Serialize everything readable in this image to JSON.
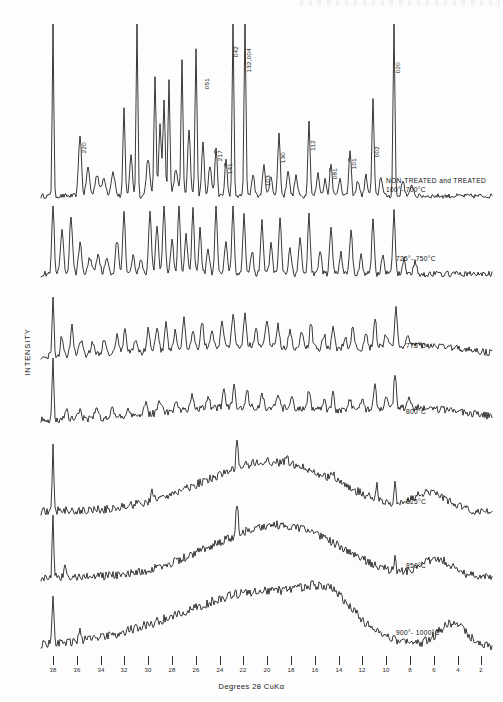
{
  "figure": {
    "ylabel": "INTENSITY",
    "xlabel": "Degrees 2θ CuKα"
  },
  "chart_data": {
    "type": "line",
    "title": "",
    "xlabel": "Degrees 2θ CuKα",
    "ylabel": "INTENSITY",
    "xlim": [
      39,
      1
    ],
    "x_axis_reversed": true,
    "grid": false,
    "legend": "inline-right-of-each-trace",
    "tick_labels": [
      "38",
      "36",
      "34",
      "32",
      "30",
      "28",
      "26",
      "24",
      "22",
      "20",
      "18",
      "16",
      "14",
      "12",
      "10",
      "8",
      "6",
      "4",
      "2"
    ],
    "tick_values": [
      38,
      36,
      34,
      32,
      30,
      28,
      26,
      24,
      22,
      20,
      18,
      16,
      14,
      12,
      10,
      8,
      6,
      4,
      2
    ],
    "peak_labels": [
      {
        "hkl": "220",
        "two_theta": 35.1
      },
      {
        "hkl": "051",
        "two_theta": 25.9
      },
      {
        "hkl": "21̅7",
        "two_theta": 23.6
      },
      {
        "hkl": "14̅1",
        "two_theta": 22.8
      },
      {
        "hkl": "042",
        "two_theta": 22.1
      },
      {
        "hkl": "132,004",
        "two_theta": 21.4
      },
      {
        "hkl": "103",
        "two_theta": 19.3
      },
      {
        "hkl": "130",
        "two_theta": 18.0
      },
      {
        "hkl": "112",
        "two_theta": 16.1
      },
      {
        "hkl": "08̅1",
        "two_theta": 13.2
      },
      {
        "hkl": "10̅1",
        "two_theta": 11.9
      },
      {
        "hkl": "002",
        "two_theta": 10.5
      },
      {
        "hkl": "020",
        "two_theta": 9.6
      }
    ],
    "series": [
      {
        "name": "NON-TREATED and TREATED\n100°- 700°C",
        "order": 1,
        "description": "fully crystalline pattern, many sharp Bragg peaks"
      },
      {
        "name": "725°- 750°C",
        "order": 2,
        "description": "crystalline peaks, broadened, clipped tops"
      },
      {
        "name": "775°C",
        "order": 3,
        "description": "peaks weaker, rising amorphous background"
      },
      {
        "name": "800°C",
        "order": 4,
        "description": "few residual peaks, strong broad hump"
      },
      {
        "name": "825°C",
        "order": 5,
        "description": "mostly amorphous with sharp spike near 38 and 22"
      },
      {
        "name": "850°C",
        "order": 6,
        "description": "amorphous hump, two sharp spikes"
      },
      {
        "name": "900°- 1000°C",
        "order": 7,
        "description": "broad amorphous halo centred near 22, no Bragg peaks"
      }
    ]
  },
  "traces": [
    {
      "id": "t1",
      "label": "NON-TREATED and TREATED\n100°- 700°C",
      "label_x": 386,
      "label_y": 176
    },
    {
      "id": "t2",
      "label": "725°- 750°C",
      "label_x": 396,
      "label_y": 254
    },
    {
      "id": "t3",
      "label": "775°C",
      "label_x": 406,
      "label_y": 341
    },
    {
      "id": "t4",
      "label": "800°C",
      "label_x": 406,
      "label_y": 407
    },
    {
      "id": "t5",
      "label": "825°C",
      "label_x": 406,
      "label_y": 497
    },
    {
      "id": "t6",
      "label": "850°C",
      "label_x": 406,
      "label_y": 561
    },
    {
      "id": "t7",
      "label": "900°- 1000°C",
      "label_x": 396,
      "label_y": 628
    }
  ],
  "axis_ticks": [
    {
      "label": "38",
      "x": 53
    },
    {
      "label": "36",
      "x": 77
    },
    {
      "label": "34",
      "x": 101
    },
    {
      "label": "32",
      "x": 124
    },
    {
      "label": "30",
      "x": 148
    },
    {
      "label": "28",
      "x": 172
    },
    {
      "label": "26",
      "x": 196
    },
    {
      "label": "24",
      "x": 220
    },
    {
      "label": "22",
      "x": 243
    },
    {
      "label": "20",
      "x": 267
    },
    {
      "label": "18",
      "x": 291
    },
    {
      "label": "16",
      "x": 315
    },
    {
      "label": "14",
      "x": 339
    },
    {
      "label": "12",
      "x": 362
    },
    {
      "label": "10",
      "x": 386
    },
    {
      "label": "8",
      "x": 410
    },
    {
      "label": "6",
      "x": 434
    },
    {
      "label": "4",
      "x": 458
    },
    {
      "label": "2",
      "x": 481
    }
  ],
  "peak_annotations": [
    {
      "text": "220",
      "x": 80,
      "y": 142,
      "overline": false
    },
    {
      "text": "051",
      "x": 203,
      "y": 78,
      "overline": false
    },
    {
      "text": "217",
      "x": 216,
      "y": 150,
      "overline": "last"
    },
    {
      "text": "141",
      "x": 226,
      "y": 163,
      "overline": "last"
    },
    {
      "text": "042",
      "x": 232,
      "y": 46,
      "overline": false
    },
    {
      "text": "132,004",
      "x": 245,
      "y": 48,
      "overline": false
    },
    {
      "text": "103",
      "x": 264,
      "y": 175,
      "overline": false
    },
    {
      "text": "130",
      "x": 279,
      "y": 152,
      "overline": false
    },
    {
      "text": "112",
      "x": 309,
      "y": 140,
      "overline": false
    },
    {
      "text": "081",
      "x": 331,
      "y": 168,
      "overline": "last"
    },
    {
      "text": "101",
      "x": 350,
      "y": 158,
      "overline": "last"
    },
    {
      "text": "002",
      "x": 373,
      "y": 146,
      "overline": false
    },
    {
      "text": "020",
      "x": 394,
      "y": 62,
      "overline": false
    }
  ]
}
